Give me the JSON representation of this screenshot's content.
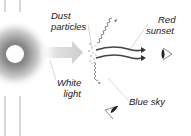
{
  "diagram": {
    "labels": {
      "dust_line1": "Dust",
      "dust_line2": "particles",
      "red_line1": "Red",
      "red_line2": "sunset",
      "white_line1": "White",
      "white_line2": "light",
      "blue": "Blue sky"
    },
    "icons": [
      "sun-icon",
      "white-light-arrow-icon",
      "dust-particles-icon",
      "red-light-wave-icon",
      "blue-light-wave-icon",
      "eye-icon"
    ],
    "colors": {
      "sun_core": "#ffffff",
      "sun_glow": "#9a9a9a",
      "arrow_fill": "#cfcfcf",
      "wave": "#555555",
      "leader_line": "#bdbdbd",
      "text": "#222222"
    }
  }
}
